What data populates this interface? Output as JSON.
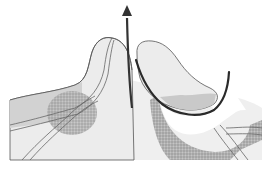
{
  "diagram": {
    "type": "anatomical-illustration",
    "labels": [],
    "colors": {
      "background": "#ffffff",
      "tissue_light": "#ececec",
      "tissue_mid": "#d0d0d0",
      "stipple_dark": "#a8a8a8",
      "outline": "#555555",
      "arrow": "#333333",
      "curve_line": "#2a2a2a"
    },
    "elements": [
      {
        "name": "left-mound",
        "description": "Raised tissue with curved peak"
      },
      {
        "name": "left-stippled-region",
        "description": "Circular stippled area"
      },
      {
        "name": "crossing-vessels",
        "description": "Two crossing tubular structures"
      },
      {
        "name": "right-lobe",
        "description": "Tilted elongated lobe"
      },
      {
        "name": "right-stippled-band",
        "description": "Dark stippled crescent under lobe"
      },
      {
        "name": "upward-arrow",
        "description": "Arrow pointing upward from the gap"
      },
      {
        "name": "u-shaped-curve",
        "description": "Thick dark U-shaped line around the lobe"
      }
    ]
  }
}
